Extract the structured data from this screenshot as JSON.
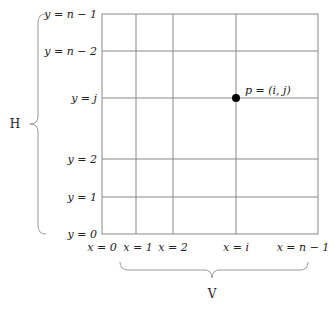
{
  "diagram": {
    "grid": {
      "x_labels": [
        "x = 0",
        "x = 1",
        "x = 2",
        "x = i",
        "x = n − 1"
      ],
      "y_labels": [
        "y = n − 1",
        "y = n − 2",
        "y = j",
        "y = 2",
        "y = 1",
        "y = 0"
      ]
    },
    "point": {
      "label": "p = (i, j)"
    },
    "braces": {
      "horizontal_label": "V",
      "vertical_label": "H"
    },
    "colors": {
      "grid": "#888888",
      "point": "#000000",
      "text": "#222222"
    }
  }
}
